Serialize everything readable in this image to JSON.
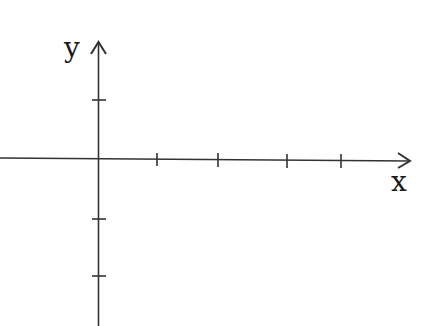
{
  "diagram": {
    "type": "cartesian-axes",
    "x_axis": {
      "label": "x",
      "ticks_positive": 4,
      "ticks_negative": 0,
      "arrow": "right"
    },
    "y_axis": {
      "label": "y",
      "ticks_positive": 1,
      "ticks_negative": 2,
      "arrow": "up"
    },
    "colors": {
      "stroke": "#333333",
      "background": "#ffffff"
    }
  }
}
